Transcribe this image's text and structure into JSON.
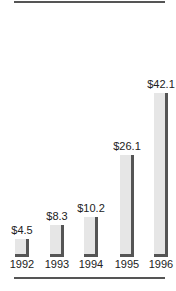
{
  "chart_data": {
    "type": "bar",
    "title": "",
    "xlabel": "",
    "ylabel": "",
    "categories": [
      "1992",
      "1993",
      "1994",
      "1995",
      "1996"
    ],
    "values": [
      4.5,
      8.3,
      10.2,
      26.1,
      42.1
    ],
    "value_labels": [
      "$4.5",
      "$8.3",
      "$10.2",
      "$26.1",
      "$42.1"
    ],
    "ylim": [
      0,
      45
    ],
    "grid": false,
    "legend": null,
    "colors": {
      "bar_fill": "#e6e6e6",
      "bar_shadow": "#555555",
      "rule": "#555555"
    }
  }
}
